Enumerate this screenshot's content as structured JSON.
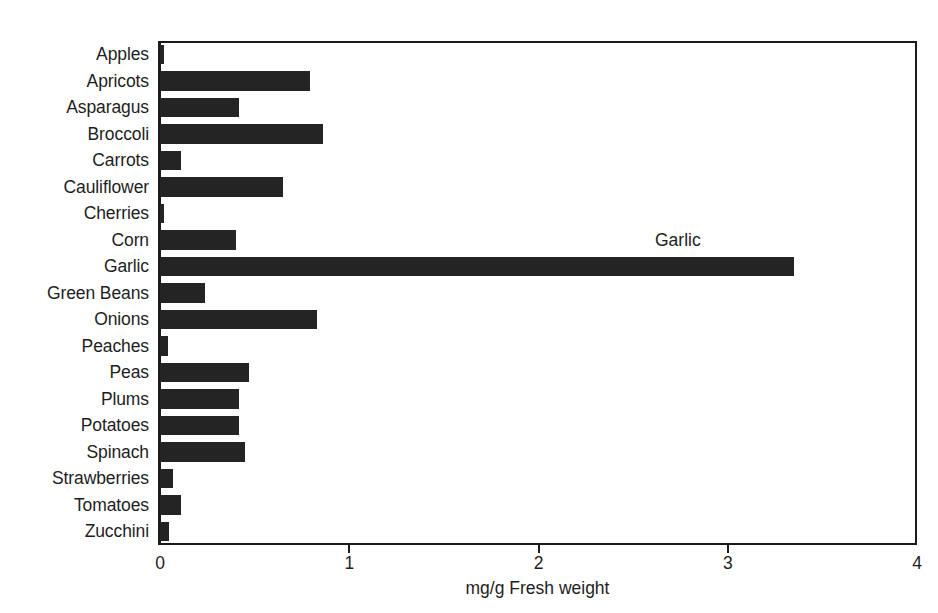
{
  "chart_data": {
    "type": "bar",
    "orientation": "horizontal",
    "title": "",
    "xlabel": "mg/g Fresh weight",
    "ylabel": "",
    "xlim": [
      0,
      4
    ],
    "xticks": [
      0,
      1,
      2,
      3,
      4
    ],
    "xtick_labels": [
      "0",
      "1",
      "2",
      "3",
      "4"
    ],
    "grid": false,
    "legend": false,
    "bar_color": "#242424",
    "categories": [
      "Apples",
      "Apricots",
      "Asparagus",
      "Broccoli",
      "Carrots",
      "Cauliflower",
      "Cherries",
      "Corn",
      "Garlic",
      "Green Beans",
      "Onions",
      "Peaches",
      "Peas",
      "Plums",
      "Potatoes",
      "Spinach",
      "Strawberries",
      "Tomatoes",
      "Zucchini"
    ],
    "values": [
      0.02,
      0.79,
      0.42,
      0.86,
      0.11,
      0.65,
      0.02,
      0.4,
      3.35,
      0.24,
      0.83,
      0.04,
      0.47,
      0.42,
      0.42,
      0.45,
      0.07,
      0.11,
      0.05
    ],
    "annotations": [
      {
        "text": "Garlic",
        "category": "Garlic",
        "value": 3.35
      }
    ]
  }
}
